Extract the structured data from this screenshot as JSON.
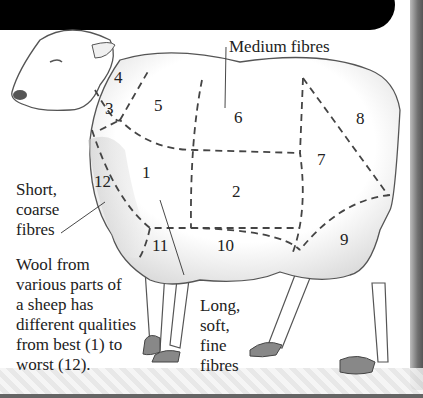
{
  "diagram": {
    "type": "labeled-illustration",
    "regions": [
      {
        "id": "1",
        "label": "1"
      },
      {
        "id": "2",
        "label": "2"
      },
      {
        "id": "3",
        "label": "3"
      },
      {
        "id": "4",
        "label": "4"
      },
      {
        "id": "5",
        "label": "5"
      },
      {
        "id": "6",
        "label": "6"
      },
      {
        "id": "7",
        "label": "7"
      },
      {
        "id": "8",
        "label": "8"
      },
      {
        "id": "9",
        "label": "9"
      },
      {
        "id": "10",
        "label": "10"
      },
      {
        "id": "11",
        "label": "11"
      },
      {
        "id": "12",
        "label": "12"
      }
    ],
    "callouts": {
      "medium": "Medium fibres",
      "short_line1": "Short,",
      "short_line2": "coarse",
      "short_line3": "fibres",
      "long_line1": "Long,",
      "long_line2": "soft,",
      "long_line3": "fine",
      "long_line4": "fibres"
    },
    "caption": {
      "line1": "Wool from",
      "line2": "various parts of",
      "line3": "a sheep has",
      "line4": "different qualities",
      "line5": "from best (1) to",
      "line6": "worst (12)."
    }
  },
  "colors": {
    "banner": "#000000",
    "ink": "#222222",
    "wool_shade": "#d8d8d8"
  }
}
